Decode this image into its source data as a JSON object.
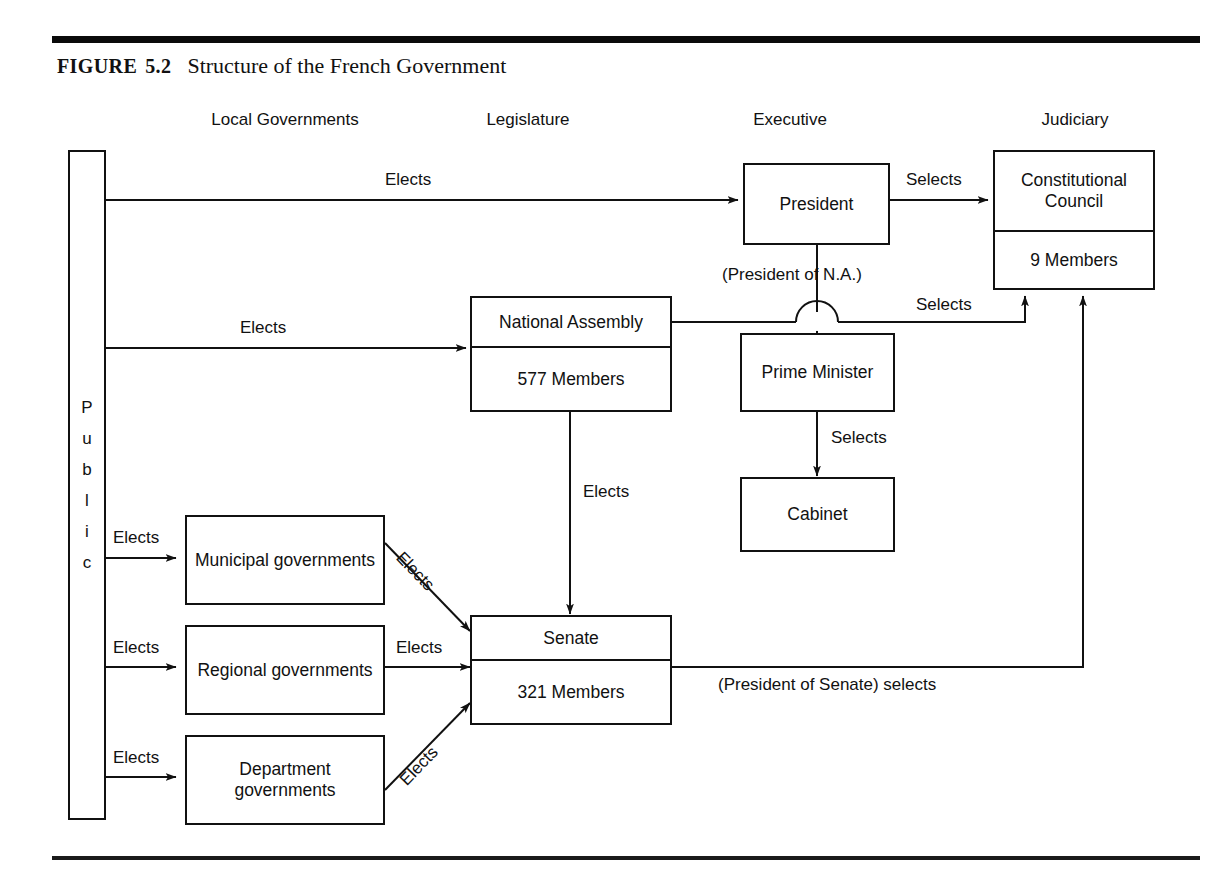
{
  "figure": {
    "label_small_caps": "FIGURE",
    "number": "5.2",
    "title": "Structure of the French Government"
  },
  "column_headers": [
    {
      "name": "local-governments",
      "label": "Local Governments"
    },
    {
      "name": "legislature",
      "label": "Legislature"
    },
    {
      "name": "executive",
      "label": "Executive"
    },
    {
      "name": "judiciary",
      "label": "Judiciary"
    }
  ],
  "public_box": {
    "label": "Public",
    "letters": [
      "P",
      "u",
      "b",
      "l",
      "i",
      "c"
    ]
  },
  "nodes": {
    "president": {
      "title": "President"
    },
    "constitutional_council": {
      "title": "Constitutional Council",
      "detail": "9 Members"
    },
    "national_assembly": {
      "title": "National Assembly",
      "detail": "577 Members"
    },
    "prime_minister": {
      "title": "Prime Minister"
    },
    "cabinet": {
      "title": "Cabinet"
    },
    "senate": {
      "title": "Senate",
      "detail": "321 Members"
    },
    "municipal": {
      "title": "Municipal governments"
    },
    "regional": {
      "title": "Regional governments"
    },
    "department": {
      "title": "Department governments"
    }
  },
  "edges": {
    "public_elects_president": "Elects",
    "president_selects_council": "Selects",
    "public_elects_national_assembly": "Elects",
    "president_of_na": "(President of N.A.)",
    "na_selects_council": "Selects",
    "pm_selects_cabinet": "Selects",
    "na_elects_senate": "Elects",
    "public_elects_municipal": "Elects",
    "public_elects_regional": "Elects",
    "public_elects_department": "Elects",
    "municipal_elects_senate": "Elects",
    "regional_elects_senate": "Elects",
    "department_elects_senate": "Elects",
    "senate_president_selects": "(President of Senate) selects"
  },
  "colors": {
    "ink": "#111111",
    "paper": "#ffffff"
  }
}
